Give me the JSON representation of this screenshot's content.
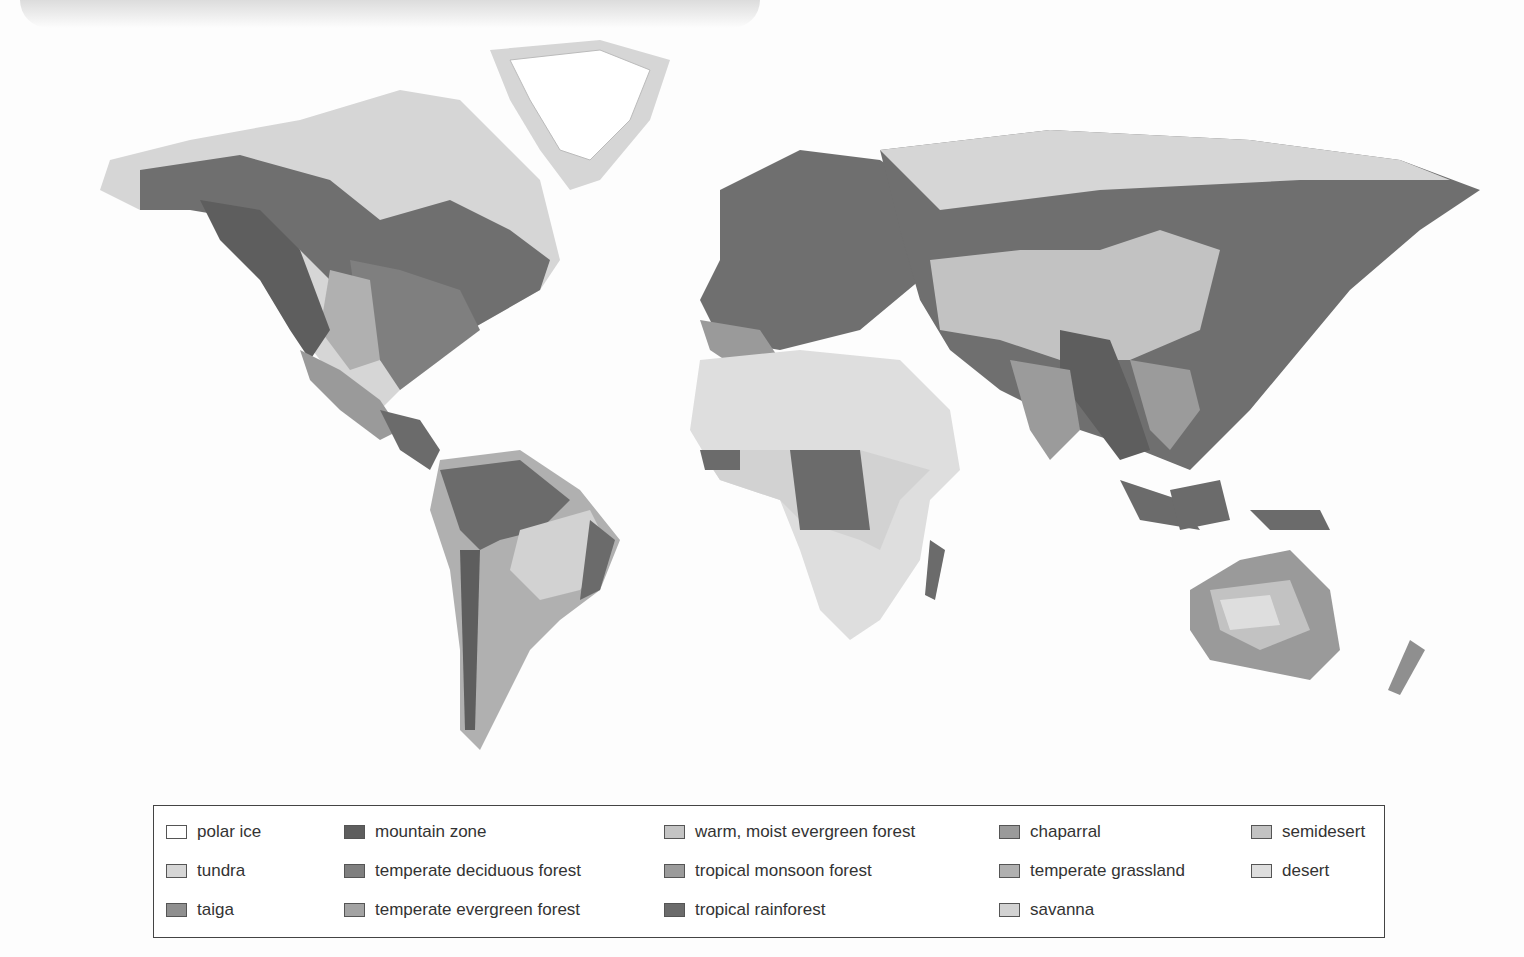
{
  "figure": {
    "map_style": "grayscale shaded relief"
  },
  "legend": {
    "items": [
      {
        "key": "polar-ice",
        "label": "polar ice",
        "color": "#ffffff",
        "col": 0,
        "row": 0
      },
      {
        "key": "tundra",
        "label": "tundra",
        "color": "#d6d6d6",
        "col": 0,
        "row": 1
      },
      {
        "key": "taiga",
        "label": "taiga",
        "color": "#8f8f8f",
        "col": 0,
        "row": 2
      },
      {
        "key": "mountain-zone",
        "label": "mountain zone",
        "color": "#5e5e5e",
        "col": 1,
        "row": 0
      },
      {
        "key": "temperate-deciduous-forest",
        "label": "temperate deciduous forest",
        "color": "#7f7f7f",
        "col": 1,
        "row": 1
      },
      {
        "key": "temperate-evergreen-forest",
        "label": "temperate evergreen forest",
        "color": "#a3a3a3",
        "col": 1,
        "row": 2
      },
      {
        "key": "warm-moist-evergreen-forest",
        "label": "warm, moist evergreen forest",
        "color": "#c4c4c4",
        "col": 2,
        "row": 0
      },
      {
        "key": "tropical-monsoon-forest",
        "label": "tropical monsoon forest",
        "color": "#9b9b9b",
        "col": 2,
        "row": 1
      },
      {
        "key": "tropical-rainforest",
        "label": "tropical rainforest",
        "color": "#6b6b6b",
        "col": 2,
        "row": 2
      },
      {
        "key": "chaparral",
        "label": "chaparral",
        "color": "#9a9a9a",
        "col": 3,
        "row": 0
      },
      {
        "key": "temperate-grassland",
        "label": "temperate grassland",
        "color": "#b0b0b0",
        "col": 3,
        "row": 1
      },
      {
        "key": "savanna",
        "label": "savanna",
        "color": "#d2d2d2",
        "col": 3,
        "row": 2
      },
      {
        "key": "semidesert",
        "label": "semidesert",
        "color": "#c2c2c2",
        "col": 4,
        "row": 0
      },
      {
        "key": "desert",
        "label": "desert",
        "color": "#dedede",
        "col": 4,
        "row": 1
      }
    ]
  },
  "regions": [
    {
      "name": "north-america",
      "label": "North America"
    },
    {
      "name": "greenland",
      "label": "Greenland"
    },
    {
      "name": "south-america",
      "label": "South America"
    },
    {
      "name": "europe",
      "label": "Europe"
    },
    {
      "name": "africa",
      "label": "Africa"
    },
    {
      "name": "asia",
      "label": "Asia"
    },
    {
      "name": "australia",
      "label": "Australia"
    },
    {
      "name": "new-zealand",
      "label": "New Zealand"
    }
  ]
}
